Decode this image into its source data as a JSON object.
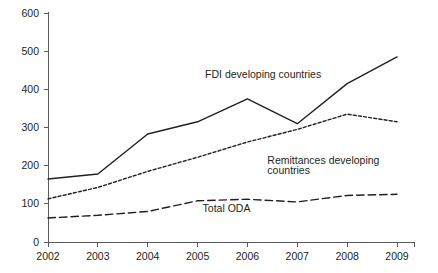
{
  "chart_data": {
    "type": "line",
    "title": "",
    "subtitle": "",
    "xlabel": "",
    "ylabel": "",
    "categories": [
      "2002",
      "2003",
      "2004",
      "2005",
      "2006",
      "2007",
      "2008",
      "2009"
    ],
    "x": [
      2002,
      2003,
      2004,
      2005,
      2006,
      2007,
      2008,
      2009
    ],
    "xlim": [
      2002,
      2009
    ],
    "ylim": [
      0,
      600
    ],
    "y_ticks": [
      0,
      100,
      200,
      300,
      400,
      500,
      600
    ],
    "y_tick_labels": [
      "0",
      "100",
      "200",
      "300",
      "400",
      "500",
      "600"
    ],
    "x_tick_labels": [
      "2002",
      "2003",
      "2004",
      "2005",
      "2006",
      "2007",
      "2008",
      "2009"
    ],
    "grid": false,
    "legend": "inline-annotations",
    "legend_position": "inline",
    "series": [
      {
        "name": "FDI developing countries",
        "style": "solid",
        "color": "#231f20",
        "values": [
          165,
          178,
          283,
          315,
          375,
          310,
          415,
          485
        ]
      },
      {
        "name": "Remittances developing countries",
        "style": "dotted",
        "color": "#231f20",
        "values": [
          113,
          143,
          185,
          222,
          262,
          295,
          335,
          315
        ]
      },
      {
        "name": "Total ODA",
        "style": "dashed",
        "color": "#231f20",
        "values": [
          63,
          70,
          80,
          108,
          112,
          105,
          122,
          125
        ]
      }
    ],
    "annotations": [
      {
        "text": "FDI developing countries",
        "x": 2005.15,
        "y": 430
      },
      {
        "text": "Remittances developing",
        "x": 2006.4,
        "y": 205
      },
      {
        "text": "countries",
        "x": 2006.4,
        "y": 178
      },
      {
        "text": "Total ODA",
        "x": 2005.1,
        "y": 78
      }
    ],
    "axis_color": "#58595b",
    "text_color": "#231f20",
    "background": "#ffffff"
  }
}
